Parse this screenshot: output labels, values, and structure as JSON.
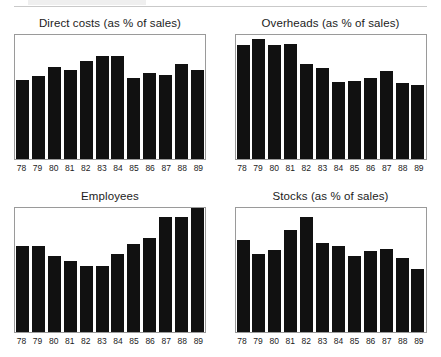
{
  "page": {
    "background_color": "#ffffff",
    "bar_color": "#111111",
    "frame_color": "#9a9a9a",
    "header_rule_visible": true
  },
  "chart_data": [
    {
      "type": "bar",
      "title": "Direct costs (as % of sales)",
      "xlabel": "",
      "ylabel": "",
      "categories": [
        "78",
        "79",
        "80",
        "81",
        "82",
        "83",
        "84",
        "85",
        "86",
        "87",
        "88",
        "89"
      ],
      "values": [
        64,
        67,
        74,
        72,
        79,
        83,
        83,
        65,
        69,
        68,
        77,
        72
      ],
      "ylim": [
        0,
        100
      ],
      "grid": false,
      "legend": "none"
    },
    {
      "type": "bar",
      "title": "Overheads (as % of sales)",
      "xlabel": "",
      "ylabel": "",
      "categories": [
        "78",
        "79",
        "80",
        "81",
        "82",
        "83",
        "84",
        "85",
        "86",
        "87",
        "88",
        "89"
      ],
      "values": [
        92,
        97,
        92,
        93,
        77,
        73,
        62,
        63,
        65,
        71,
        61,
        60
      ],
      "ylim": [
        0,
        100
      ],
      "grid": false,
      "legend": "none"
    },
    {
      "type": "bar",
      "title": "Employees",
      "xlabel": "",
      "ylabel": "",
      "categories": [
        "78",
        "79",
        "80",
        "81",
        "82",
        "83",
        "84",
        "85",
        "86",
        "87",
        "88",
        "89"
      ],
      "values": [
        69,
        69,
        61,
        57,
        53,
        53,
        63,
        71,
        76,
        93,
        93,
        100
      ],
      "ylim": [
        0,
        100
      ],
      "grid": false,
      "legend": "none"
    },
    {
      "type": "bar",
      "title": "Stocks (as % of sales)",
      "xlabel": "",
      "ylabel": "",
      "categories": [
        "78",
        "79",
        "80",
        "81",
        "82",
        "83",
        "84",
        "85",
        "86",
        "87",
        "88",
        "89"
      ],
      "values": [
        74,
        63,
        66,
        82,
        93,
        72,
        69,
        61,
        65,
        67,
        60,
        51
      ],
      "ylim": [
        0,
        100
      ],
      "grid": false,
      "legend": "none"
    }
  ]
}
